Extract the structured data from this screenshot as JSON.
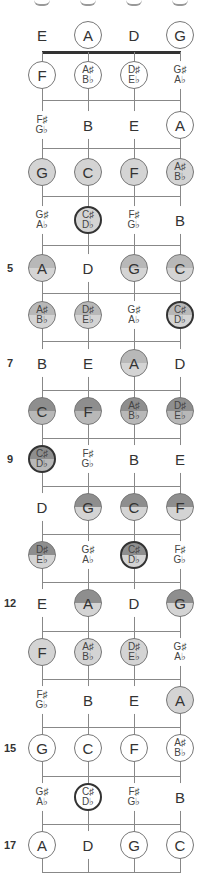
{
  "diagram": {
    "strings": [
      "E",
      "A",
      "D",
      "G"
    ],
    "string_x": [
      42,
      88,
      134,
      180
    ],
    "colors": {
      "light": "#d4d4d4",
      "medium": "#b8b8b8",
      "dark": "#8e8e8e",
      "outline": "#777777",
      "bold_outline": "#333333",
      "line": "#888888",
      "nut": "#333333"
    },
    "nut_y": 52,
    "fret_lines_y": [
      100,
      148,
      196,
      245,
      293,
      341,
      390,
      438,
      486,
      534,
      582,
      631,
      679,
      727,
      776,
      824,
      872
    ],
    "rows": [
      {
        "fret": "0",
        "label": "",
        "y": 35,
        "notes": [
          {
            "t": "E",
            "style": "plain"
          },
          {
            "t": "A",
            "style": "circle"
          },
          {
            "t": "D",
            "style": "plain"
          },
          {
            "t": "G",
            "style": "circle"
          }
        ]
      },
      {
        "fret": "1",
        "label": "",
        "y": 75,
        "notes": [
          {
            "t": "F",
            "style": "circle"
          },
          {
            "t": "A♯",
            "b": "B♭",
            "style": "circle"
          },
          {
            "t": "D♯",
            "b": "E♭",
            "style": "circle"
          },
          {
            "t": "G♯",
            "b": "A♭",
            "style": "plain"
          }
        ]
      },
      {
        "fret": "2",
        "label": "",
        "y": 125,
        "notes": [
          {
            "t": "F♯",
            "b": "G♭",
            "style": "plain"
          },
          {
            "t": "B",
            "style": "plain"
          },
          {
            "t": "E",
            "style": "plain"
          },
          {
            "t": "A",
            "style": "circle"
          }
        ]
      },
      {
        "fret": "3",
        "label": "",
        "y": 172,
        "notes": [
          {
            "t": "G",
            "style": "light"
          },
          {
            "t": "C",
            "style": "light"
          },
          {
            "t": "F",
            "style": "light"
          },
          {
            "t": "A♯",
            "b": "B♭",
            "style": "light"
          }
        ]
      },
      {
        "fret": "4",
        "label": "",
        "y": 220,
        "notes": [
          {
            "t": "G♯",
            "b": "A♭",
            "style": "plain"
          },
          {
            "t": "C♯",
            "b": "D♭",
            "style": "light-bold"
          },
          {
            "t": "F♯",
            "b": "G♭",
            "style": "plain"
          },
          {
            "t": "B",
            "style": "plain"
          }
        ]
      },
      {
        "fret": "5",
        "label": "5",
        "y": 268,
        "notes": [
          {
            "t": "A",
            "style": "split-med"
          },
          {
            "t": "D",
            "style": "plain"
          },
          {
            "t": "G",
            "style": "split-med"
          },
          {
            "t": "C",
            "style": "split-med"
          }
        ]
      },
      {
        "fret": "6",
        "label": "",
        "y": 315,
        "notes": [
          {
            "t": "A♯",
            "b": "B♭",
            "style": "split-med"
          },
          {
            "t": "D♯",
            "b": "E♭",
            "style": "split-med"
          },
          {
            "t": "G♯",
            "b": "A♭",
            "style": "plain"
          },
          {
            "t": "C♯",
            "b": "D♭",
            "style": "split-med-bold"
          }
        ]
      },
      {
        "fret": "7",
        "label": "7",
        "y": 363,
        "notes": [
          {
            "t": "B",
            "style": "plain"
          },
          {
            "t": "E",
            "style": "plain"
          },
          {
            "t": "A",
            "style": "split-med"
          },
          {
            "t": "D",
            "style": "plain"
          }
        ]
      },
      {
        "fret": "8",
        "label": "",
        "y": 411,
        "notes": [
          {
            "t": "C",
            "style": "split-dark"
          },
          {
            "t": "F",
            "style": "split-dark"
          },
          {
            "t": "A♯",
            "b": "B♭",
            "style": "split-dark"
          },
          {
            "t": "D♯",
            "b": "E♭",
            "style": "split-dark"
          }
        ]
      },
      {
        "fret": "9",
        "label": "9",
        "y": 459,
        "notes": [
          {
            "t": "C♯",
            "b": "D♭",
            "style": "split-dark-bold"
          },
          {
            "t": "F♯",
            "b": "G♭",
            "style": "plain"
          },
          {
            "t": "B",
            "style": "plain"
          },
          {
            "t": "E",
            "style": "plain"
          }
        ]
      },
      {
        "fret": "10",
        "label": "",
        "y": 507,
        "notes": [
          {
            "t": "D",
            "style": "plain"
          },
          {
            "t": "G",
            "style": "split-darktop"
          },
          {
            "t": "C",
            "style": "split-darktop"
          },
          {
            "t": "F",
            "style": "split-darktop"
          }
        ]
      },
      {
        "fret": "11",
        "label": "",
        "y": 555,
        "notes": [
          {
            "t": "D♯",
            "b": "E♭",
            "style": "split-darktop"
          },
          {
            "t": "G♯",
            "b": "A♭",
            "style": "plain"
          },
          {
            "t": "C♯",
            "b": "D♭",
            "style": "split-darktop-bold"
          },
          {
            "t": "F♯",
            "b": "G♭",
            "style": "plain"
          }
        ]
      },
      {
        "fret": "12",
        "label": "12",
        "y": 603,
        "notes": [
          {
            "t": "E",
            "style": "plain"
          },
          {
            "t": "A",
            "style": "split-darktop"
          },
          {
            "t": "D",
            "style": "plain"
          },
          {
            "t": "G",
            "style": "split-darktop"
          }
        ]
      },
      {
        "fret": "13",
        "label": "",
        "y": 652,
        "notes": [
          {
            "t": "F",
            "style": "light"
          },
          {
            "t": "A♯",
            "b": "B♭",
            "style": "light"
          },
          {
            "t": "D♯",
            "b": "E♭",
            "style": "light"
          },
          {
            "t": "G♯",
            "b": "A♭",
            "style": "plain"
          }
        ]
      },
      {
        "fret": "14",
        "label": "",
        "y": 700,
        "notes": [
          {
            "t": "F♯",
            "b": "G♭",
            "style": "plain"
          },
          {
            "t": "B",
            "style": "plain"
          },
          {
            "t": "E",
            "style": "plain"
          },
          {
            "t": "A",
            "style": "light"
          }
        ]
      },
      {
        "fret": "15",
        "label": "15",
        "y": 748,
        "notes": [
          {
            "t": "G",
            "style": "circle"
          },
          {
            "t": "C",
            "style": "circle"
          },
          {
            "t": "F",
            "style": "circle"
          },
          {
            "t": "A♯",
            "b": "B♭",
            "style": "circle"
          }
        ]
      },
      {
        "fret": "16",
        "label": "",
        "y": 797,
        "notes": [
          {
            "t": "G♯",
            "b": "A♭",
            "style": "plain"
          },
          {
            "t": "C♯",
            "b": "D♭",
            "style": "circle-bold"
          },
          {
            "t": "F♯",
            "b": "G♭",
            "style": "plain"
          },
          {
            "t": "B",
            "style": "plain"
          }
        ]
      },
      {
        "fret": "17",
        "label": "17",
        "y": 845,
        "notes": [
          {
            "t": "A",
            "style": "circle"
          },
          {
            "t": "D",
            "style": "plain"
          },
          {
            "t": "G",
            "style": "circle"
          },
          {
            "t": "C",
            "style": "circle"
          }
        ]
      }
    ]
  }
}
